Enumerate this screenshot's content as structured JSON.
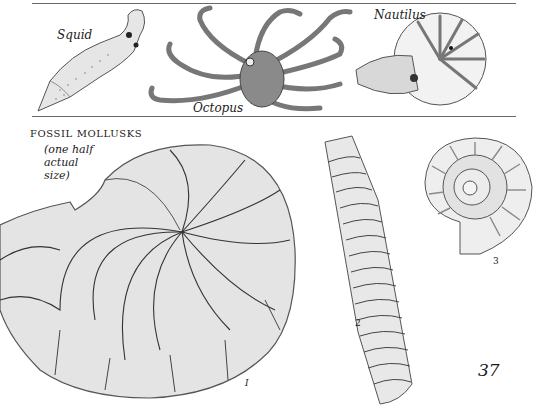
{
  "top_panel": {
    "labels": {
      "squid": "Squid",
      "octopus": "Octopus",
      "nautilus": "Nautilus"
    }
  },
  "fossil_section": {
    "title": "FOSSIL MOLLUSKS",
    "subtitle_lines": [
      "(one half",
      "actual",
      "size)"
    ],
    "figure_numbers": [
      "I",
      "2",
      "3"
    ]
  },
  "page_number": "37",
  "colors": {
    "ink": "#1a1a1a",
    "shade": "#9a9a9a",
    "rule": "#6a6a6a",
    "paper": "#ffffff"
  }
}
